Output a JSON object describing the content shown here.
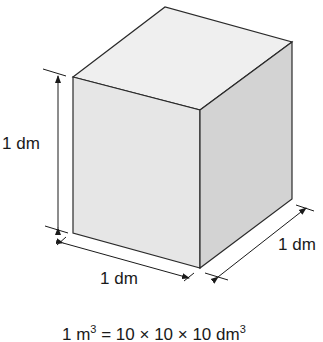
{
  "diagram": {
    "labels": {
      "height": "1 dm",
      "width": "1 dm",
      "depth": "1 dm"
    },
    "formula": {
      "lhs_base": "1 m",
      "lhs_exp": "3",
      "middle": " = 10 × 10 × 10 dm",
      "rhs_exp": "3"
    },
    "colors": {
      "top_face": "#efefef",
      "front_face": "#e6e6e6",
      "side_face": "#d2d2d2",
      "edge": "#2a2a2a"
    }
  }
}
